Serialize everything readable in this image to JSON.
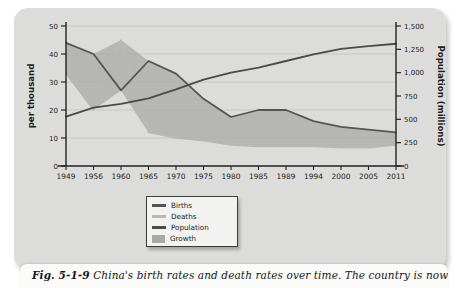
{
  "figure": {
    "caption_prefix": "Fig. 5-1-9",
    "caption_text": "China's birth rates and death rates over time. The country is now"
  },
  "legend": {
    "items": [
      {
        "label": "Births",
        "type": "line",
        "color": "#555555"
      },
      {
        "label": "Deaths",
        "type": "line",
        "color": "#b8b8b6"
      },
      {
        "label": "Population",
        "type": "line",
        "color": "#4a4a4a"
      },
      {
        "label": "Growth",
        "type": "area",
        "color": "#a9a9a6"
      }
    ]
  },
  "chart_data": {
    "type": "line",
    "title": "",
    "xlabel": "",
    "ylabel": "per thousand",
    "y2label": "Population (millions)",
    "grid": true,
    "legend_position": "bottom-center",
    "categories": [
      "1949",
      "1956",
      "1960",
      "1965",
      "1970",
      "1975",
      "1980",
      "1985",
      "1989",
      "1994",
      "2000",
      "2005",
      "2011"
    ],
    "x_tick_labels": [
      "1949",
      "1956",
      "1960",
      "1965",
      "1970",
      "1975",
      "1980",
      "1985",
      "1989",
      "1994",
      "2000",
      "2005",
      "2011"
    ],
    "ylim": [
      0,
      50
    ],
    "y_ticks": [
      0,
      10,
      20,
      30,
      40,
      50
    ],
    "y_tick_labels": [
      "0",
      "10",
      "20",
      "30",
      "40",
      "50"
    ],
    "y2lim": [
      0,
      1500
    ],
    "y2_ticks": [
      0,
      250,
      500,
      750,
      1000,
      1250,
      1500
    ],
    "y2_tick_labels": [
      "0",
      "250",
      "500",
      "750",
      "1,000",
      "1,250",
      "1,500"
    ],
    "series": [
      {
        "name": "Births",
        "axis": "left",
        "color": "#555555",
        "values": [
          44,
          40,
          27,
          37.5,
          33,
          24,
          17.5,
          20,
          20,
          16,
          14,
          13,
          12
        ]
      },
      {
        "name": "Deaths",
        "axis": "left",
        "color": "#b8b8b6",
        "values": [
          33,
          20,
          45,
          12,
          10,
          9,
          7.5,
          7,
          7,
          7,
          6.5,
          6.5,
          7.5
        ]
      },
      {
        "name": "Population",
        "axis": "right",
        "color": "#4a4a4a",
        "values": [
          530,
          625,
          665,
          725,
          820,
          925,
          1000,
          1055,
          1125,
          1195,
          1255,
          1285,
          1310
        ]
      }
    ],
    "area_fill": {
      "name": "Growth",
      "color": "#a9a9a6",
      "between": [
        "Births",
        "Deaths"
      ]
    },
    "annotations": []
  }
}
